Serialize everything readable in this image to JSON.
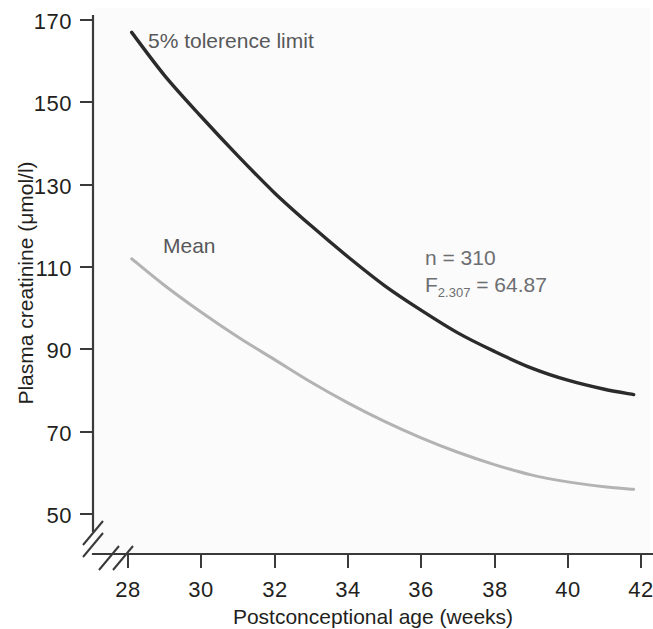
{
  "chart_data": {
    "type": "line",
    "title": "",
    "xlabel": "Postconceptional age (weeks)",
    "ylabel": "Plasma creatinine (μmol/l)",
    "xlim": [
      28,
      42
    ],
    "ylim": [
      50,
      170
    ],
    "xticks": [
      28,
      30,
      32,
      34,
      36,
      38,
      40,
      42
    ],
    "xtick_labels": [
      "28",
      "30",
      "32",
      "34",
      "36",
      "38",
      "40",
      "42"
    ],
    "yticks": [
      50,
      70,
      90,
      110,
      130,
      150,
      170
    ],
    "ytick_labels": [
      "50",
      "70",
      "90",
      "110",
      "130",
      "150",
      "170"
    ],
    "grid": false,
    "legend_position": "inline-labels",
    "axis_break_x": true,
    "axis_break_y": true,
    "x": [
      28.1,
      29,
      30,
      31,
      32,
      33,
      34,
      35,
      36,
      37,
      38,
      39,
      40,
      41,
      41.8
    ],
    "series": [
      {
        "name": "5% tolerence limit",
        "color": "#2b2b2b",
        "values": [
          167.0,
          156.5,
          146.5,
          137.0,
          128.0,
          120.0,
          112.5,
          105.5,
          99.5,
          94.0,
          89.5,
          85.5,
          82.5,
          80.3,
          79.0
        ]
      },
      {
        "name": "Mean",
        "color": "#b3b3b3",
        "values": [
          112.0,
          105.5,
          99.0,
          93.0,
          87.5,
          82.0,
          77.0,
          72.5,
          68.5,
          65.0,
          62.0,
          59.5,
          57.8,
          56.6,
          56.0
        ]
      }
    ],
    "annotations": [
      {
        "id": "series-label-upper",
        "text": "5% tolerence limit",
        "x": 30.0,
        "y": 160.0
      },
      {
        "id": "series-label-mean",
        "text": "Mean",
        "x": 29.8,
        "y": 113.0
      },
      {
        "id": "stats-n",
        "text": "n = 310",
        "x": 38.0,
        "y": 116.0
      },
      {
        "id": "stats-f",
        "text": "F",
        "subscript": "2.307",
        "tail": " = 64.87",
        "x": 38.0,
        "y": 110.0
      }
    ]
  },
  "labels": {
    "y_axis_title": "Plasma creatinine (μmol/l)",
    "x_axis_title": "Postconceptional age (weeks)",
    "upper_series": "5% tolerence limit",
    "mean_series": "Mean",
    "stat_n": "n = 310",
    "stat_f_base": "F",
    "stat_f_subscript": "2.307",
    "stat_f_value": " = 64.87"
  },
  "colors": {
    "upper_curve": "#2b2b2b",
    "mean_curve": "#b3b3b3",
    "axis": "#3a3a3a",
    "text": "#231f20",
    "annotation_text": "#6d6e71",
    "background": "#ffffff"
  }
}
